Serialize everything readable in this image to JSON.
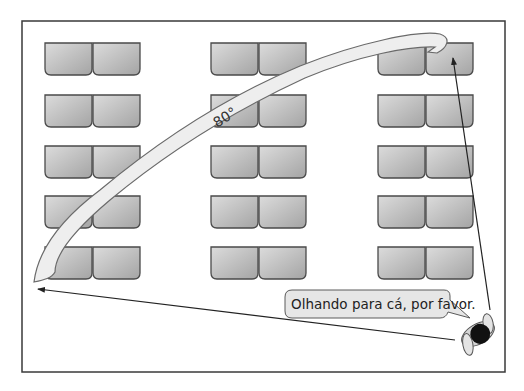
{
  "diagram": {
    "angle_label": "80°",
    "speech_bubble": "Olhando para cá, por favor.",
    "colors": {
      "frame": "#3a3a3a",
      "desk_fill_light": "#d6d6d6",
      "desk_fill_dark": "#a8a8a8",
      "desk_stroke": "#4a4a4a",
      "arc_fill": "#eeeeee",
      "arc_stroke": "#6a6a6a",
      "bubble_fill": "#e6e6e6",
      "teacher_head": "#111111",
      "teacher_body": "#cfcfcf"
    },
    "desk_columns": 3,
    "desk_rows": 5,
    "desks_per_group": 2,
    "elements": {
      "teacher": "teacher-top-view",
      "arrow_to_front_right": "sight-line-arrow",
      "arrow_to_back_left": "sight-line-arrow"
    }
  }
}
